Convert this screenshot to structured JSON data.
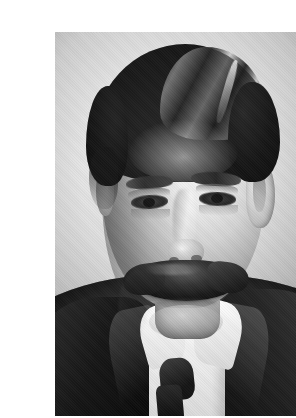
{
  "page": {
    "background_color": "#ffffff",
    "width": 296,
    "height": 418
  },
  "photograph": {
    "title": "",
    "caption": "",
    "alt_text": "Black-and-white halftone portrait photograph of a middle-aged man",
    "medium": "halftone print",
    "color_mode": "black and white",
    "orientation": "portrait",
    "frame": {
      "left": 15,
      "top": 16,
      "width": 262,
      "height": 384,
      "border": "none"
    },
    "tones": {
      "backdrop_light": "#e4e4e4",
      "backdrop_dark": "#b4b4b4",
      "skin_highlight": "#f6f4f1",
      "skin_midtone": "#d8d4cd",
      "hair_dark": "#121110",
      "suit_dark": "#1d1d1d",
      "shirt_white": "#fbfbfb"
    },
    "subject": {
      "description": "Middle-aged man, head-and-shoulders studio portrait, facing slightly to the viewer's left",
      "hair": "Dark, thick, combed back with a side part on his left",
      "facial_hair": "Large full walrus moustache",
      "eyes": "Dark, looking toward the camera",
      "attire_jacket": "Dark suit jacket with peaked lapels",
      "attire_shirt": "White stiff wing collar",
      "attire_tie": "Dark necktie"
    }
  }
}
